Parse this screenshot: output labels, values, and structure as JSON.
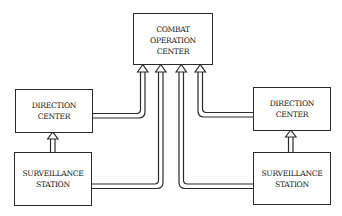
{
  "diagram": {
    "type": "block-diagram",
    "colors": {
      "stroke": "#2a2a2a",
      "text": "#1a1a1a",
      "background": "#ffffff"
    },
    "nodes": {
      "combat_operation_center": {
        "lines": [
          "COMBAT",
          "OPERATION",
          "CENTER"
        ]
      },
      "direction_center_left": {
        "lines": [
          "DIRECTION",
          "CENTER"
        ]
      },
      "surveillance_station_left": {
        "lines": [
          "SURVEILLANCE",
          "STATION"
        ]
      },
      "direction_center_right": {
        "lines": [
          "DIRECTION",
          "CENTER"
        ]
      },
      "surveillance_station_right": {
        "lines": [
          "SURVEILLANCE",
          "STATION"
        ]
      }
    },
    "edges": [
      {
        "from": "surveillance_station_left",
        "to": "direction_center_left",
        "style": "hollow-double-arrow"
      },
      {
        "from": "surveillance_station_right",
        "to": "direction_center_right",
        "style": "hollow-double-arrow"
      },
      {
        "from": "direction_center_left",
        "to": "combat_operation_center",
        "style": "hollow-double-arrow"
      },
      {
        "from": "surveillance_station_left",
        "to": "combat_operation_center",
        "style": "hollow-double-arrow"
      },
      {
        "from": "surveillance_station_right",
        "to": "combat_operation_center",
        "style": "hollow-double-arrow"
      },
      {
        "from": "direction_center_right",
        "to": "combat_operation_center",
        "style": "hollow-double-arrow"
      }
    ]
  }
}
